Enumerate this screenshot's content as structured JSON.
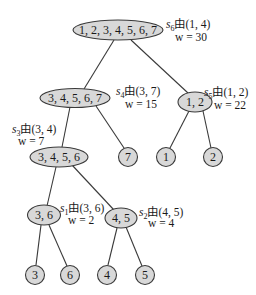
{
  "diagram": {
    "type": "tree",
    "nodes": [
      {
        "id": "n1234567",
        "label": "1, 2, 3, 4, 5, 6, 7"
      },
      {
        "id": "n34567",
        "label": "3, 4, 5, 6, 7"
      },
      {
        "id": "n12",
        "label": "1, 2"
      },
      {
        "id": "n3456",
        "label": "3, 4, 5, 6"
      },
      {
        "id": "n7",
        "label": "7"
      },
      {
        "id": "n1",
        "label": "1"
      },
      {
        "id": "n2",
        "label": "2"
      },
      {
        "id": "n36",
        "label": "3, 6"
      },
      {
        "id": "n45",
        "label": "4, 5"
      },
      {
        "id": "n3",
        "label": "3"
      },
      {
        "id": "n6",
        "label": "6"
      },
      {
        "id": "n4",
        "label": "4"
      },
      {
        "id": "n5",
        "label": "5"
      }
    ],
    "edges": [
      [
        "n1234567",
        "n34567"
      ],
      [
        "n1234567",
        "n12"
      ],
      [
        "n34567",
        "n3456"
      ],
      [
        "n34567",
        "n7"
      ],
      [
        "n12",
        "n1"
      ],
      [
        "n12",
        "n2"
      ],
      [
        "n3456",
        "n36"
      ],
      [
        "n3456",
        "n45"
      ],
      [
        "n36",
        "n3"
      ],
      [
        "n36",
        "n6"
      ],
      [
        "n45",
        "n4"
      ],
      [
        "n45",
        "n5"
      ]
    ],
    "annotations": {
      "s6": {
        "s": "s",
        "sub": "6",
        "via": "由(1, 4)",
        "w": "w = 30"
      },
      "s4": {
        "s": "s",
        "sub": "4",
        "via": "由(3, 7)",
        "w": "w = 15"
      },
      "s5": {
        "s": "s",
        "sub": "5",
        "via": "由(1, 2)",
        "w": "w = 22"
      },
      "s3": {
        "s": "s",
        "sub": "3",
        "via": "由(3, 4)",
        "w": "w = 7"
      },
      "s1": {
        "s": "s",
        "sub": "1",
        "via": "由(3, 6)",
        "w": "w = 2"
      },
      "s2": {
        "s": "s",
        "sub": "2",
        "via": "由(4, 5)",
        "w": "w = 4"
      }
    }
  }
}
